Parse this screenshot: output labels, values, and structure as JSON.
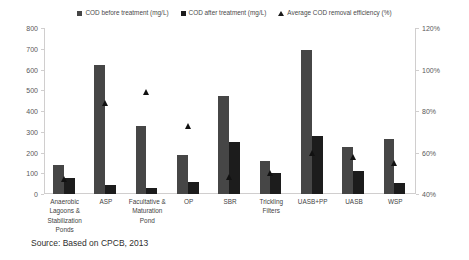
{
  "chart_data": {
    "type": "bar",
    "title": "",
    "subtitle": "",
    "xlabel": "",
    "ylabel": "",
    "grid": false,
    "legend_position": "top-center",
    "categories": [
      "Anaerobic Lagoons & Stabilization Ponds",
      "ASP",
      "Facultative & Maturation Pond",
      "OP",
      "SBR",
      "Trickling Filters",
      "UASB+PP",
      "UASB",
      "WSP"
    ],
    "category_labels": [
      "Anaerobic\nLagoons &\nStabilization\nPonds",
      "ASP",
      "Facultative &\nMaturation\nPond",
      "OP",
      "SBR",
      "Trickling\nFilters",
      "UASB+PP",
      "UASB",
      "WSP"
    ],
    "series": [
      {
        "name": "COD before treatment (mg/L)",
        "axis": "left",
        "unit": "mg/L",
        "color": "#464646",
        "values": [
          140,
          620,
          330,
          190,
          470,
          160,
          695,
          225,
          265
        ]
      },
      {
        "name": "COD after treatment (mg/L)",
        "axis": "left",
        "unit": "mg/L",
        "color": "#1c1c1c",
        "values": [
          75,
          45,
          30,
          60,
          250,
          100,
          280,
          110,
          55
        ]
      },
      {
        "name": "Average COD removal efficiency (%)",
        "axis": "right",
        "unit": "%",
        "color": "#111111",
        "marker": "triangle",
        "values": [
          47,
          84,
          89,
          73,
          48,
          50,
          60,
          58,
          55
        ]
      }
    ],
    "ylim": [
      0,
      800
    ],
    "yticks": [
      0,
      100,
      200,
      300,
      400,
      500,
      600,
      700,
      800
    ],
    "ytick_labels": [
      "0",
      "100",
      "200",
      "300",
      "400",
      "500",
      "600",
      "700",
      "800"
    ],
    "y2lim": [
      40,
      120
    ],
    "y2ticks": [
      40,
      60,
      80,
      100,
      120
    ],
    "y2tick_labels": [
      "40%",
      "60%",
      "80%",
      "100%",
      "120%"
    ]
  },
  "legend": {
    "items": [
      {
        "label": "COD before treatment (mg/L)",
        "marker": "square",
        "color": "#464646"
      },
      {
        "label": "COD after treatment (mg/L)",
        "marker": "square",
        "color": "#1c1c1c"
      },
      {
        "label": "Average COD removal efficiency (%)",
        "marker": "triangle",
        "color": "#1a1a1a"
      }
    ]
  },
  "source": {
    "text": "Source: Based on CPCB, 2013"
  }
}
